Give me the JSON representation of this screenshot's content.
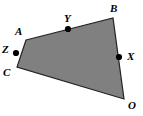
{
  "figure": {
    "type": "geometry-quadrilateral",
    "width": 143,
    "height": 116,
    "background_color": "#ffffff",
    "fill_color": "#808080",
    "stroke_color": "#222222",
    "stroke_width": 1.2,
    "point_color": "#000000",
    "point_radius": 3.1,
    "polygon_name": "quadrilateral-ABOC",
    "polygon_points": "26,40 113,18 124,99 17,67",
    "vertices": [
      {
        "id": "A",
        "label": "A",
        "x": 26,
        "y": 40,
        "label_x": 15,
        "label_y": 26,
        "marked": false
      },
      {
        "id": "B",
        "label": "B",
        "x": 113,
        "y": 18,
        "label_x": 110,
        "label_y": 3,
        "marked": false
      },
      {
        "id": "O",
        "label": "O",
        "x": 124,
        "y": 99,
        "label_x": 128,
        "label_y": 100,
        "marked": false
      },
      {
        "id": "C",
        "label": "C",
        "x": 17,
        "y": 67,
        "label_x": 3,
        "label_y": 67,
        "marked": false
      }
    ],
    "midpoints": [
      {
        "id": "Y",
        "label": "Y",
        "on_segment": "AB",
        "x": 68,
        "y": 29,
        "label_x": 64,
        "label_y": 13
      },
      {
        "id": "X",
        "label": "X",
        "on_segment": "BO",
        "x": 119,
        "y": 57,
        "label_x": 127,
        "label_y": 51
      },
      {
        "id": "Z",
        "label": "Z",
        "on_segment": "CA",
        "x": 16,
        "y": 53,
        "label_x": 2,
        "label_y": 44
      }
    ],
    "edges": [
      {
        "id": "AB",
        "from": "A",
        "to": "B"
      },
      {
        "id": "BO",
        "from": "B",
        "to": "O"
      },
      {
        "id": "OC",
        "from": "O",
        "to": "C"
      },
      {
        "id": "CA",
        "from": "C",
        "to": "A"
      }
    ]
  }
}
